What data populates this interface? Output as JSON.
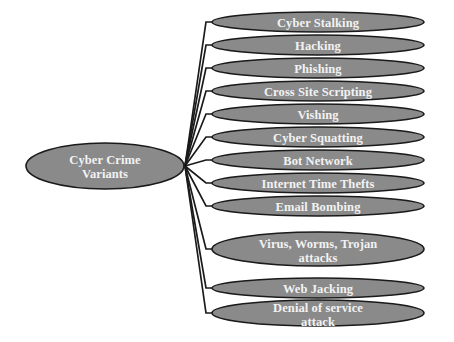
{
  "diagram": {
    "title": "Cyber Crime Variants",
    "type": "radial-tree",
    "background_color": "#ffffff",
    "node_fill_color": "#8a8a8a",
    "node_stroke_color": "#1a1a1a",
    "node_text_color": "#f2f2f2",
    "connector_color": "#1a1a1a",
    "root": {
      "label_line1": "Cyber Crime",
      "label_line2": "Variants",
      "cx": 105,
      "cy": 166,
      "rx": 79,
      "ry": 23
    },
    "hub": {
      "x": 185,
      "y": 166
    },
    "leaves": [
      {
        "id": "cyber-stalking",
        "label": "Cyber Stalking",
        "label2": "",
        "cx": 318,
        "cy": 22,
        "rx": 106,
        "ry": 10
      },
      {
        "id": "hacking",
        "label": "Hacking",
        "label2": "",
        "cx": 318,
        "cy": 45,
        "rx": 106,
        "ry": 10
      },
      {
        "id": "phishing",
        "label": "Phishing",
        "label2": "",
        "cx": 318,
        "cy": 68,
        "rx": 106,
        "ry": 10
      },
      {
        "id": "cross-site-scripting",
        "label": "Cross Site Scripting",
        "label2": "",
        "cx": 318,
        "cy": 91,
        "rx": 106,
        "ry": 10
      },
      {
        "id": "vishing",
        "label": "Vishing",
        "label2": "",
        "cx": 318,
        "cy": 114,
        "rx": 106,
        "ry": 10
      },
      {
        "id": "cyber-squatting",
        "label": "Cyber Squatting",
        "label2": "",
        "cx": 318,
        "cy": 137,
        "rx": 106,
        "ry": 10
      },
      {
        "id": "bot-network",
        "label": "Bot Network",
        "label2": "",
        "cx": 318,
        "cy": 160,
        "rx": 106,
        "ry": 10
      },
      {
        "id": "internet-time-thefts",
        "label": "Internet Time Thefts",
        "label2": "",
        "cx": 318,
        "cy": 183,
        "rx": 106,
        "ry": 10
      },
      {
        "id": "email-bombing",
        "label": "Email Bombing",
        "label2": "",
        "cx": 318,
        "cy": 206,
        "rx": 106,
        "ry": 10
      },
      {
        "id": "virus-worms-trojan",
        "label": "Virus, Worms, Trojan",
        "label2": "attacks",
        "cx": 318,
        "cy": 249,
        "rx": 106,
        "ry": 17
      },
      {
        "id": "web-jacking",
        "label": "Web Jacking",
        "label2": "",
        "cx": 318,
        "cy": 288,
        "rx": 106,
        "ry": 10
      },
      {
        "id": "denial-of-service",
        "label": "Denial of service",
        "label2": "attack",
        "cx": 318,
        "cy": 313,
        "rx": 106,
        "ry": 13
      }
    ]
  }
}
